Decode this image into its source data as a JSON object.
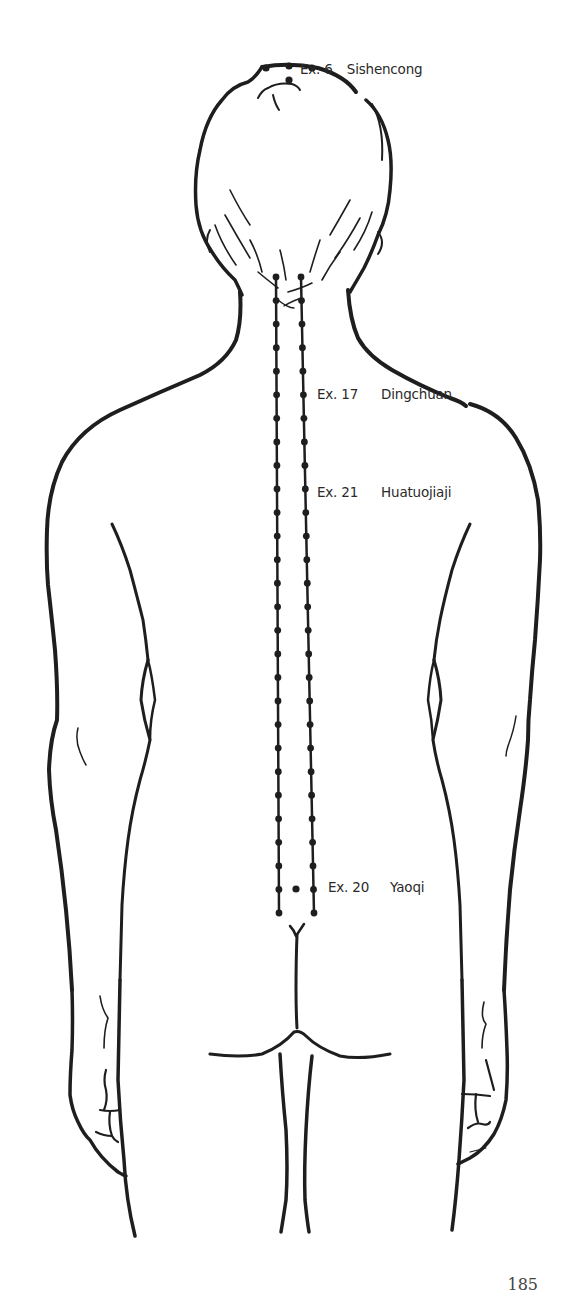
{
  "figure": {
    "colors": {
      "line": "#1e1e1e",
      "text": "#2a2a2a",
      "background": "#ffffff"
    }
  },
  "labels": [
    {
      "code": "Ex. 6",
      "name": "Sishencong"
    },
    {
      "code": "Ex. 17",
      "name": "Dingchuan"
    },
    {
      "code": "Ex. 21",
      "name": "Huatuojiaji"
    },
    {
      "code": "Ex. 20",
      "name": "Yaoqi"
    }
  ],
  "points": {
    "sishencong": [
      [
        266,
        68
      ],
      [
        289,
        66
      ],
      [
        312,
        68
      ],
      [
        289,
        80
      ]
    ],
    "huatuojiaji_left_x": 276,
    "huatuojiaji_right_x_top": 301,
    "huatuojiaji_right_x_bottom": 314,
    "huatuojiaji_y_start": 277,
    "huatuojiaji_y_end": 913,
    "huatuojiaji_dot_count": 28,
    "yaoqi": [
      296,
      889
    ]
  },
  "page": {
    "number": "185"
  }
}
